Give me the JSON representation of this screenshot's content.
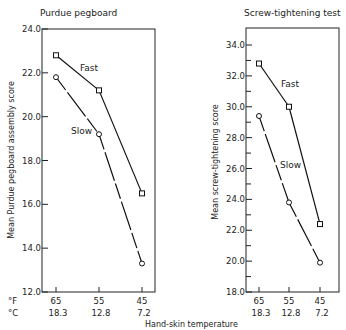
{
  "chart_data": [
    {
      "type": "line",
      "title": "Purdue pegboard",
      "xlabel": "Hand-skin temperature",
      "ylabel": "Mean Purdue pegboard assembly score",
      "categories": [
        "65",
        "55",
        "45"
      ],
      "categories_celsius": [
        "18.3",
        "12.8",
        "7.2"
      ],
      "x_unit_labels": [
        "°F",
        "°C"
      ],
      "ylim": [
        12.0,
        24.0
      ],
      "yticks": [
        "24.0",
        "22.0",
        "20.0",
        "18.0",
        "16.0",
        "14.0",
        "12.0"
      ],
      "series": [
        {
          "name": "Fast",
          "marker": "square",
          "values": [
            22.8,
            21.2,
            16.5
          ]
        },
        {
          "name": "Slow",
          "marker": "circle",
          "values": [
            21.8,
            19.2,
            13.3
          ]
        }
      ]
    },
    {
      "type": "line",
      "title": "Screw-tightening test",
      "xlabel": "Hand-skin temperature",
      "ylabel": "Mean screw-tightening score",
      "categories": [
        "65",
        "55",
        "45"
      ],
      "categories_celsius": [
        "18.3",
        "12.8",
        "7.2"
      ],
      "ylim": [
        18.0,
        35.0
      ],
      "yticks": [
        "34.0",
        "32.0",
        "30.0",
        "28.0",
        "26.0",
        "24.0",
        "22.0",
        "20.0",
        "18.0"
      ],
      "series": [
        {
          "name": "Fast",
          "marker": "square",
          "values": [
            32.8,
            30.0,
            22.4
          ]
        },
        {
          "name": "Slow",
          "marker": "circle",
          "values": [
            29.4,
            23.8,
            19.9
          ]
        }
      ]
    }
  ],
  "left": {
    "title": "Purdue pegboard",
    "ylabel": "Mean Purdue pegboard assembly score",
    "fast_label": "Fast",
    "slow_label": "Slow",
    "unit_f": "°F",
    "unit_c": "°C"
  },
  "right": {
    "title": "Screw-tightening test",
    "ylabel": "Mean screw-tightening score",
    "fast_label": "Fast",
    "slow_label": "Slow"
  },
  "xlabel": "Hand-skin temperature"
}
